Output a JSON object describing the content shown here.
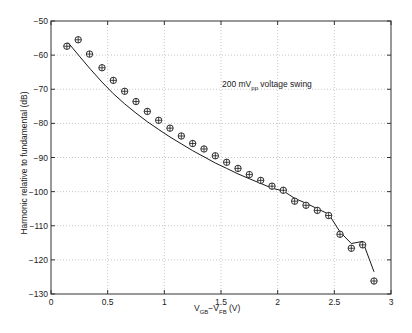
{
  "chart_data": {
    "type": "line+scatter",
    "title": "",
    "xlabel": {
      "main": "V",
      "sub1": "GB",
      "mid": "−V",
      "sub2": "FB",
      "unit": " (V)"
    },
    "xlabel_text": "VGB−VFB (V)",
    "ylabel": "Harmonic relative to fundamental (dB)",
    "annotation": {
      "pre": "200 mV",
      "sub": "pp",
      "post": " voltage swing",
      "text": "200 mVpp voltage swing",
      "x": 1.5,
      "y": -69.5
    },
    "xlim": [
      0,
      3
    ],
    "ylim": [
      -130,
      -50
    ],
    "xticks": [
      0,
      0.5,
      1,
      1.5,
      2,
      2.5,
      3
    ],
    "xtick_labels": [
      "0",
      "0.5",
      "1",
      "1.5",
      "2",
      "2.5",
      "3"
    ],
    "yticks": [
      -50,
      -60,
      -70,
      -80,
      -90,
      -100,
      -110,
      -120,
      -130
    ],
    "ytick_labels": [
      "−50",
      "−60",
      "−70",
      "−80",
      "−90",
      "−100",
      "−110",
      "−120",
      "−130"
    ],
    "grid": true,
    "series": [
      {
        "name": "measured",
        "style": "markers (circle-plus)",
        "x": [
          0.14,
          0.24,
          0.34,
          0.45,
          0.55,
          0.65,
          0.75,
          0.85,
          0.95,
          1.05,
          1.15,
          1.25,
          1.35,
          1.45,
          1.55,
          1.65,
          1.75,
          1.85,
          1.95,
          2.05,
          2.15,
          2.25,
          2.35,
          2.45,
          2.55,
          2.65,
          2.75,
          2.85
        ],
        "y": [
          -57.4,
          -55.5,
          -59.7,
          -63.7,
          -67.4,
          -70.6,
          -73.6,
          -76.5,
          -79.1,
          -81.4,
          -83.7,
          -85.9,
          -87.5,
          -89.5,
          -91.4,
          -93.2,
          -95.0,
          -96.7,
          -98.4,
          -99.6,
          -102.8,
          -104.0,
          -105.5,
          -107.0,
          -112.5,
          -116.6,
          -115.6,
          -126.2
        ]
      },
      {
        "name": "simulated",
        "style": "solid line",
        "x": [
          0.15,
          0.25,
          0.35,
          0.45,
          0.55,
          0.65,
          0.75,
          0.85,
          0.95,
          1.05,
          1.15,
          1.25,
          1.35,
          1.45,
          1.55,
          1.65,
          1.75,
          1.85,
          1.95,
          2.05,
          2.15,
          2.25,
          2.35,
          2.45,
          2.55,
          2.65,
          2.75,
          2.85
        ],
        "y": [
          -56.3,
          -60.3,
          -64.2,
          -67.9,
          -71.3,
          -74.3,
          -77.0,
          -79.5,
          -81.8,
          -84.0,
          -86.0,
          -88.0,
          -89.8,
          -91.6,
          -93.2,
          -94.8,
          -96.2,
          -97.6,
          -99.0,
          -99.8,
          -102.0,
          -103.4,
          -105.0,
          -106.6,
          -111.8,
          -115.2,
          -114.6,
          -123.5
        ]
      }
    ]
  }
}
